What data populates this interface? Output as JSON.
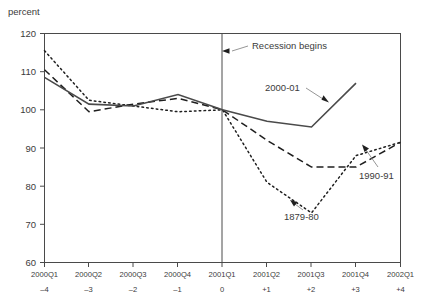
{
  "chart_data": {
    "type": "line",
    "title": "",
    "subtitle": "",
    "ylabel": "percent",
    "xlabel": "",
    "ylim": [
      60,
      120
    ],
    "ytick_values": [
      60,
      70,
      80,
      90,
      100,
      110,
      120
    ],
    "ytick_labels": [
      "60",
      "70",
      "80",
      "90",
      "100",
      "110",
      "120"
    ],
    "grid": false,
    "legend_position": "inline-annotations",
    "x": [
      -4,
      -3,
      -2,
      -1,
      0,
      1,
      2,
      3,
      4
    ],
    "xtick_labels": [
      "2000Q1",
      "2000Q2",
      "2000Q3",
      "2000Q4",
      "2001Q1",
      "2001Q2",
      "2001Q3",
      "2001Q4",
      "2002Q1"
    ],
    "xtick_sublabels": [
      "–4",
      "–3",
      "–2",
      "–1",
      "0",
      "+1",
      "+2",
      "+3",
      "+4"
    ],
    "series": [
      {
        "name": "2000-01",
        "style": "solid",
        "color": "#4a4a4a",
        "values": [
          108.5,
          101.5,
          101.0,
          104.0,
          100.0,
          97.0,
          95.5,
          107.0,
          null
        ]
      },
      {
        "name": "1990-91",
        "style": "dashed",
        "color": "#1f1f1f",
        "values": [
          110.5,
          99.5,
          101.5,
          103.0,
          100.0,
          92.0,
          85.0,
          85.0,
          91.5
        ]
      },
      {
        "name": "1879-80",
        "style": "dotted",
        "color": "#1f1f1f",
        "values": [
          115.5,
          102.5,
          101.0,
          99.5,
          100.0,
          81.0,
          73.0,
          88.0,
          91.5
        ]
      }
    ],
    "annotations": [
      {
        "name": "recession-begins",
        "text": "Recession begins",
        "points_to_x": 0,
        "points_to_y": 114.0
      },
      {
        "name": "series-2000-01",
        "text": "2000-01",
        "points_to_x": 2.55,
        "points_to_y": 102.0
      },
      {
        "name": "series-1990-91",
        "text": "1990-91",
        "points_to_x": 3.45,
        "points_to_y": 89.5
      },
      {
        "name": "series-1879-80",
        "text": "1879-80",
        "points_to_x": 2.45,
        "points_to_y": 77.5
      }
    ]
  },
  "axis": {
    "y_title": "percent"
  },
  "ticks": {
    "y": [
      "120",
      "110",
      "100",
      "90",
      "80",
      "70",
      "60"
    ],
    "x_period": [
      "2000Q1",
      "2000Q2",
      "2000Q3",
      "2000Q4",
      "2001Q1",
      "2001Q2",
      "2001Q3",
      "2001Q4",
      "2002Q1"
    ],
    "x_offset": [
      "–4",
      "–3",
      "–2",
      "–1",
      "0",
      "+1",
      "+2",
      "+3",
      "+4"
    ]
  },
  "annotations": {
    "recession": "Recession begins",
    "s2000": "2000-01",
    "s1990": "1990-91",
    "s1879": "1879-80"
  }
}
